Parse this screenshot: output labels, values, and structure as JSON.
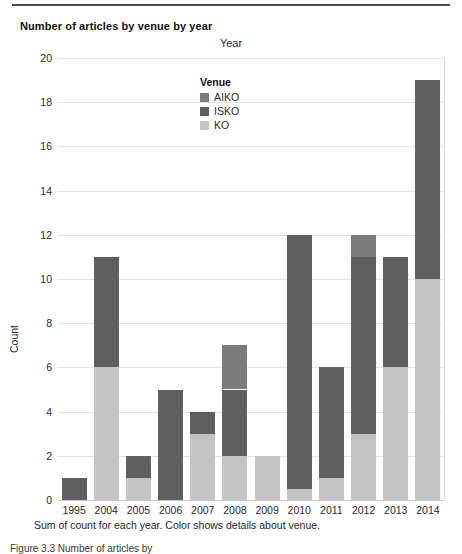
{
  "figure": {
    "title": "Number of articles by venue by year",
    "caption": "Sum of count for each year. Color shows details about venue.",
    "note": "Figure 3.3 Number of articles by"
  },
  "legend": {
    "title": "Venue",
    "items": [
      {
        "label": "AIKO",
        "color": "#7c7c7c"
      },
      {
        "label": "ISKO",
        "color": "#5f5f5f"
      },
      {
        "label": "KO",
        "color": "#c3c3c3"
      }
    ]
  },
  "chart_data": {
    "type": "bar",
    "stacked": true,
    "title": "Number of articles by venue by year",
    "xlabel": "Year",
    "ylabel": "Count",
    "ylim": [
      0,
      20
    ],
    "yticks": [
      0,
      2,
      4,
      6,
      8,
      10,
      12,
      14,
      16,
      18,
      20
    ],
    "grid": true,
    "legend_position": "inside-top-left",
    "categories": [
      "1995",
      "2004",
      "2005",
      "2006",
      "2007",
      "2008",
      "2009",
      "2010",
      "2011",
      "2012",
      "2013",
      "2014"
    ],
    "series": [
      {
        "name": "KO",
        "color": "#c3c3c3",
        "values": [
          0,
          6,
          1,
          0,
          3,
          2,
          2,
          0.5,
          1,
          3,
          6,
          10
        ]
      },
      {
        "name": "ISKO",
        "color": "#5f5f5f",
        "values": [
          1,
          5,
          1,
          5,
          1,
          3,
          0,
          11.5,
          5,
          8,
          5,
          9
        ]
      },
      {
        "name": "AIKO",
        "color": "#7c7c7c",
        "values": [
          0,
          0,
          0,
          0,
          0,
          2,
          0,
          0,
          0,
          1,
          0,
          0
        ]
      }
    ],
    "totals": [
      1,
      11,
      2,
      5,
      4,
      7,
      2,
      12,
      6,
      12,
      11,
      19
    ]
  }
}
